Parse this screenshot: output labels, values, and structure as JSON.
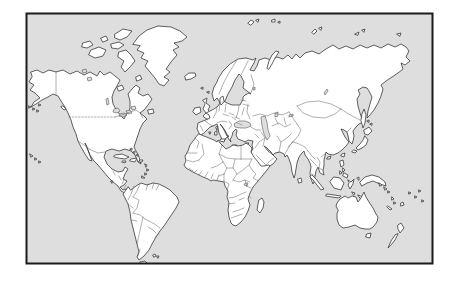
{
  "image": {
    "kind": "framed blank political outline map of the world",
    "visible_text": "",
    "projection_hint": "miller-cylindrical world map, no labels, no graticule"
  },
  "map": {
    "colors": {
      "page_background": "#ffffff",
      "ocean": "#dedede",
      "land": "#ffffff",
      "coastline": "#3a3a3a",
      "country_border": "#6e6e6e",
      "frame_border": "#1b1b1b"
    },
    "style_notes": {
      "us_canada_border": "dotted",
      "country_borders": "thin gray solid lines",
      "frame": "2px black rectangle inset on white page"
    },
    "regions": [
      "North America",
      "Greenland",
      "Canadian Arctic Islands",
      "Caribbean",
      "South America",
      "Iceland",
      "British Isles",
      "Scandinavia",
      "Europe",
      "Africa",
      "Madagascar",
      "Russia / Siberia",
      "Middle East",
      "India",
      "East Asia",
      "Japan",
      "Southeast Asia",
      "Indonesia",
      "Philippines",
      "New Guinea",
      "Australia",
      "New Zealand",
      "Pacific Islands"
    ]
  }
}
